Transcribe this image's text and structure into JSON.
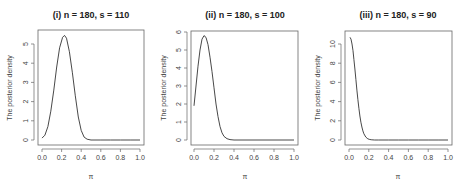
{
  "chart_data": [
    {
      "type": "line",
      "title": "(i) n = 180,  s = 110",
      "xlabel": "π",
      "ylabel": "The posterior density",
      "xlim": [
        0,
        1
      ],
      "ylim": [
        0,
        5.5
      ],
      "xticks": [
        "0.0",
        "0.2",
        "0.4",
        "0.6",
        "0.8",
        "1.0"
      ],
      "yticks": [
        "0",
        "1",
        "2",
        "3",
        "4",
        "5"
      ],
      "grid": false,
      "x": [
        0.0,
        0.03,
        0.06,
        0.09,
        0.12,
        0.15,
        0.18,
        0.21,
        0.23,
        0.25,
        0.28,
        0.31,
        0.34,
        0.37,
        0.4,
        0.43,
        0.46,
        0.5,
        0.6,
        0.7,
        0.8,
        0.9,
        1.0
      ],
      "y": [
        0.1,
        0.25,
        0.7,
        1.5,
        2.6,
        3.8,
        4.8,
        5.35,
        5.45,
        5.3,
        4.6,
        3.5,
        2.3,
        1.2,
        0.5,
        0.15,
        0.04,
        0.0,
        0.0,
        0.0,
        0.0,
        0.0,
        0.0
      ]
    },
    {
      "type": "line",
      "title": "(ii) n = 180, s = 100",
      "xlabel": "π",
      "ylabel": "The posterior density",
      "xlim": [
        0,
        1
      ],
      "ylim": [
        0,
        6
      ],
      "xticks": [
        "0.0",
        "0.2",
        "0.4",
        "0.6",
        "0.8",
        "1.0"
      ],
      "yticks": [
        "0",
        "1",
        "2",
        "3",
        "4",
        "5",
        "6"
      ],
      "grid": false,
      "x": [
        0.0,
        0.02,
        0.04,
        0.06,
        0.08,
        0.1,
        0.12,
        0.14,
        0.16,
        0.18,
        0.2,
        0.22,
        0.24,
        0.26,
        0.28,
        0.3,
        0.33,
        0.36,
        0.4,
        0.5,
        0.6,
        0.7,
        0.8,
        0.9,
        1.0
      ],
      "y": [
        1.9,
        3.0,
        4.1,
        5.0,
        5.6,
        5.8,
        5.7,
        5.3,
        4.6,
        3.8,
        2.9,
        2.0,
        1.3,
        0.75,
        0.4,
        0.2,
        0.07,
        0.02,
        0.0,
        0.0,
        0.0,
        0.0,
        0.0,
        0.0,
        0.0
      ]
    },
    {
      "type": "line",
      "title": "(iii) n = 180, s = 90",
      "xlabel": "π",
      "ylabel": "The posterior density",
      "xlim": [
        0,
        1
      ],
      "ylim": [
        0,
        10.7
      ],
      "xticks": [
        "0.0",
        "0.2",
        "0.4",
        "0.6",
        "0.8",
        "1.0"
      ],
      "yticks": [
        "0",
        "2",
        "4",
        "6",
        "8",
        "10"
      ],
      "grid": false,
      "x": [
        0.01,
        0.02,
        0.03,
        0.04,
        0.05,
        0.06,
        0.07,
        0.08,
        0.09,
        0.1,
        0.11,
        0.12,
        0.13,
        0.14,
        0.15,
        0.17,
        0.19,
        0.21,
        0.23,
        0.26,
        0.3,
        0.4,
        0.5,
        0.6,
        0.7,
        0.8,
        0.9,
        1.0
      ],
      "y": [
        10.7,
        10.5,
        10.0,
        9.3,
        8.4,
        7.4,
        6.3,
        5.2,
        4.2,
        3.3,
        2.5,
        1.85,
        1.35,
        0.95,
        0.65,
        0.3,
        0.12,
        0.05,
        0.02,
        0.0,
        0.0,
        0.0,
        0.0,
        0.0,
        0.0,
        0.0,
        0.0,
        0.0
      ]
    }
  ]
}
